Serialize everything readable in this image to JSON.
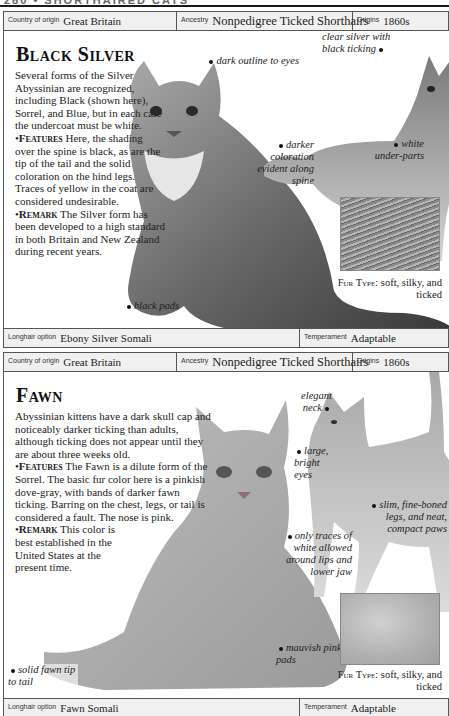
{
  "running_head": "280 • SHORTHAIRED CATS",
  "sections": [
    {
      "info": {
        "country_label": "Country of origin",
        "country_value": "Great Britain",
        "ancestry_label": "Ancestry",
        "ancestry_value": "Nonpedigree Ticked Shorthairs",
        "origins_label": "Origins",
        "origins_value": "1860s"
      },
      "title": "Black Silver",
      "intro": "Several forms of the Silver Abyssinian are recognized, including Black (shown here), Sorrel, and Blue, but in each case the undercoat must be white.",
      "features_label": "Features",
      "features_text": "Here, the shading over the spine is black, as are the tip of the tail and the solid coloration on the hind legs. Traces of yellow in the coat are considered undesirable.",
      "remark_label": "Remark",
      "remark_text": "The Silver form has been developed to a high standard in both Britain and New Zealand during recent years.",
      "captions": {
        "eyes": "dark outline to eyes",
        "ticking": "clear silver with black ticking",
        "spine": "darker coloration evident along spine",
        "underparts": "white under-parts",
        "pads": "black pads"
      },
      "fur_type_label": "Fur Type:",
      "fur_type_value": "soft, silky, and ticked",
      "footer": {
        "longhair_label": "Longhair option",
        "longhair_value": "Ebony Silver Somali",
        "temperament_label": "Temperament",
        "temperament_value": "Adaptable"
      }
    },
    {
      "info": {
        "country_label": "Country of origin",
        "country_value": "Great Britain",
        "ancestry_label": "Ancestry",
        "ancestry_value": "Nonpedigree Ticked Shorthairs",
        "origins_label": "Origins",
        "origins_value": "1860s"
      },
      "title": "Fawn",
      "intro": "Abyssinian kittens have a dark skull cap and noticeably darker ticking than adults, although ticking does not appear until they are about three weeks old.",
      "features_label": "Features",
      "features_text": "The Fawn is a dilute form of the Sorrel. The basic fur color here is a pinkish dove-gray, with bands of darker fawn ticking. Barring on the chest, legs, or tail is considered a fault. The nose is pink.",
      "remark_label": "Remark",
      "remark_text": "This color is best established in the United States at the present time.",
      "captions": {
        "neck": "elegant neck",
        "eyes": "large, bright eyes",
        "white": "only traces of white allowed around lips and lower jaw",
        "legs": "slim, fine-boned legs, and neat, compact paws",
        "pads": "mauvish pink pads",
        "tail": "solid fawn tip to tail"
      },
      "fur_type_label": "Fur Type:",
      "fur_type_value": "soft, silky, and ticked",
      "footer": {
        "longhair_label": "Longhair option",
        "longhair_value": "Fawn Somali",
        "temperament_label": "Temperament",
        "temperament_value": "Adaptable"
      }
    }
  ]
}
